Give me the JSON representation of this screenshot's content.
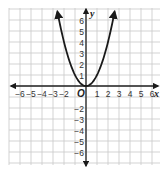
{
  "chart_data": {
    "type": "line",
    "title": "",
    "function": "y = x^2",
    "xlabel": "x",
    "ylabel": "y",
    "origin_label": "O",
    "xlim": [
      -7,
      6.5
    ],
    "ylim": [
      -7,
      7
    ],
    "grid": true,
    "x_ticks": [
      -6,
      -5,
      -4,
      -3,
      -2,
      1,
      2,
      3,
      4,
      5,
      6
    ],
    "y_ticks": [
      -6,
      -5,
      -4,
      -3,
      -2,
      1,
      2,
      3,
      4,
      5,
      6
    ],
    "x_tick_labels": [
      "-6",
      "-5",
      "-4",
      "-3",
      "-2",
      "1",
      "2",
      "3",
      "4",
      "5",
      "6"
    ],
    "y_tick_labels": [
      "-6",
      "-5",
      "-4",
      "-3",
      "-2",
      "1",
      "2",
      "3",
      "4",
      "5",
      "6"
    ],
    "series": [
      {
        "name": "parabola",
        "x": [
          -2.6,
          -2,
          -1.5,
          -1,
          -0.5,
          0,
          0.5,
          1,
          1.5,
          2,
          2.6
        ],
        "y": [
          6.76,
          4,
          2.25,
          1,
          0.25,
          0,
          0.25,
          1,
          2.25,
          4,
          6.76
        ],
        "arrows_at_ends": true
      }
    ],
    "legend": null
  },
  "style": {
    "grid_color": "#c8c8c8",
    "axis_color": "#222222",
    "curve_color": "#1a1a1a"
  }
}
